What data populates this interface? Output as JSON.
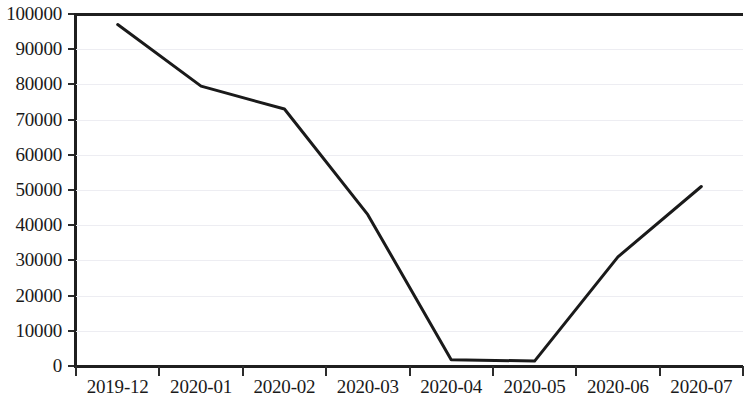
{
  "chart_data": {
    "type": "line",
    "title": "",
    "subtitle": "",
    "xlabel": "",
    "ylabel": "",
    "categories": [
      "2019-12",
      "2020-01",
      "2020-02",
      "2020-03",
      "2020-04",
      "2020-05",
      "2020-06",
      "2020-07"
    ],
    "values": [
      97000,
      79500,
      73000,
      43000,
      1800,
      1400,
      31000,
      51000
    ],
    "series": [
      {
        "name": "",
        "values": [
          97000,
          79500,
          73000,
          43000,
          1800,
          1400,
          31000,
          51000
        ]
      }
    ],
    "ylim": [
      0,
      100000
    ],
    "yticks": [
      0,
      10000,
      20000,
      30000,
      40000,
      50000,
      60000,
      70000,
      80000,
      90000,
      100000
    ],
    "ytick_labels": [
      "0",
      "10000",
      "20000",
      "30000",
      "40000",
      "50000",
      "60000",
      "70000",
      "80000",
      "90000",
      "100000"
    ],
    "grid": true,
    "grid_axis": "y",
    "legend": false,
    "legend_position": "none",
    "line_color": "#1a1a1a",
    "line_width": 3,
    "markers": false,
    "annotations": []
  }
}
